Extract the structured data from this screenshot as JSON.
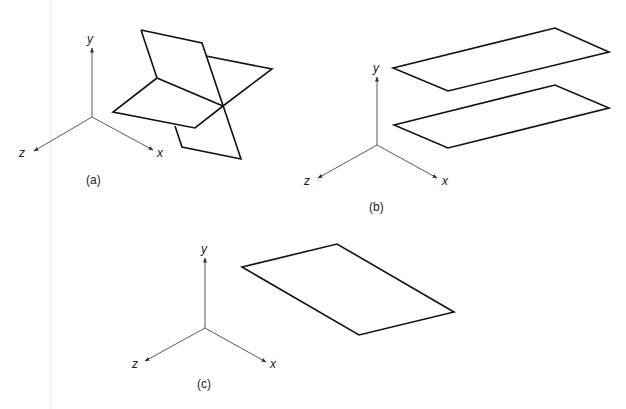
{
  "figure": {
    "panels": [
      {
        "id": "a",
        "caption": "(a)",
        "description": "Two intersecting planes",
        "axes": {
          "origin": [
            92,
            117
          ],
          "y_end": [
            92,
            48
          ],
          "z_end": [
            34,
            151
          ],
          "x_end": [
            153,
            150
          ],
          "labels": {
            "y": "y",
            "z": "z",
            "x": "x"
          },
          "label_pos": {
            "y": [
              91,
              42
            ],
            "z": [
              25,
              157
            ],
            "x": [
              160,
              156
            ]
          }
        },
        "caption_pos": [
          94,
          184
        ],
        "planes": [
          {
            "name": "tilted-vertical-plane",
            "points": "141,30 202,43 241,159 182,147 175,126 157,78 141,30"
          },
          {
            "name": "horizontal-plane",
            "points": "157,78 223,106 272,69 208,56 M 157,78 113,112 195,128 223,106"
          }
        ]
      },
      {
        "id": "b",
        "caption": "(b)",
        "description": "Two parallel planes",
        "axes": {
          "origin": [
            377,
            145
          ],
          "y_end": [
            377,
            77
          ],
          "z_end": [
            318,
            178
          ],
          "x_end": [
            437,
            178
          ],
          "labels": {
            "y": "y",
            "z": "z",
            "x": "x"
          },
          "label_pos": {
            "y": [
              377,
              71
            ],
            "z": [
              310,
              185
            ],
            "x": [
              445,
              185
            ]
          }
        },
        "caption_pos": [
          377,
          211
        ],
        "planes": [
          {
            "name": "upper-plane",
            "points": "393,68 555,28 609,52 448,91"
          },
          {
            "name": "lower-plane",
            "points": "394,125 555,85 609,108 448,148"
          }
        ]
      },
      {
        "id": "c",
        "caption": "(c)",
        "description": "Single plane",
        "axes": {
          "origin": [
            205,
            328
          ],
          "y_end": [
            205,
            258
          ],
          "z_end": [
            145,
            361
          ],
          "x_end": [
            266,
            362
          ],
          "labels": {
            "y": "y",
            "z": "z",
            "x": "x"
          },
          "label_pos": {
            "y": [
              205,
              252
            ],
            "z": [
              137,
              367
            ],
            "x": [
              273,
              368
            ]
          }
        },
        "caption_pos": [
          205,
          388
        ],
        "planes": [
          {
            "name": "single-plane",
            "points": "242,267 337,244 454,312 359,335"
          }
        ]
      }
    ]
  },
  "colors": {
    "axis": "#5a5a5a",
    "plane": "#111111",
    "margin_line": "#e6e6e6",
    "background": "#ffffff"
  }
}
